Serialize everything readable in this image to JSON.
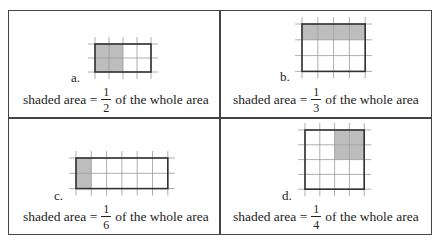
{
  "figure": {
    "panels": [
      {
        "id": "a",
        "letter": "a.",
        "grid": {
          "cols": 4,
          "rows": 2,
          "shaded": [
            [
              0,
              0
            ],
            [
              1,
              0
            ],
            [
              0,
              1
            ],
            [
              1,
              1
            ]
          ]
        },
        "caption_prefix": "shaded area =",
        "numerator": "1",
        "denominator": "2",
        "caption_suffix": "of the whole area"
      },
      {
        "id": "b",
        "letter": "b.",
        "grid": {
          "cols": 4,
          "rows": 3,
          "shaded": [
            [
              0,
              0
            ],
            [
              1,
              0
            ],
            [
              2,
              0
            ],
            [
              3,
              0
            ]
          ]
        },
        "caption_prefix": "shaded area =",
        "numerator": "1",
        "denominator": "3",
        "caption_suffix": "of the whole area"
      },
      {
        "id": "c",
        "letter": "c.",
        "grid": {
          "cols": 6,
          "rows": 2,
          "shaded": [
            [
              0,
              0
            ],
            [
              0,
              1
            ]
          ]
        },
        "caption_prefix": "shaded area =",
        "numerator": "1",
        "denominator": "6",
        "caption_suffix": "of the whole area"
      },
      {
        "id": "d",
        "letter": "d.",
        "grid": {
          "cols": 4,
          "rows": 4,
          "shaded": [
            [
              2,
              0
            ],
            [
              3,
              0
            ],
            [
              2,
              1
            ],
            [
              3,
              1
            ]
          ]
        },
        "caption_prefix": "shaded area =",
        "numerator": "1",
        "denominator": "4",
        "caption_suffix": "of the whole area"
      }
    ],
    "colors": {
      "shade": "#bdbdbd",
      "gridline": "#9a9a9a",
      "outline": "#333333",
      "border": "#444444"
    }
  }
}
